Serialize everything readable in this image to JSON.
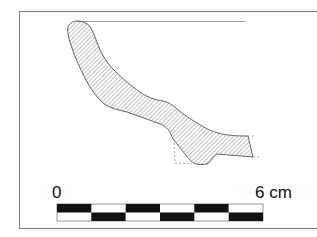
{
  "figure": {
    "type": "pottery-profile-drawing",
    "scale_bar": {
      "start_label": "0",
      "end_label": "6 cm",
      "segments": 6,
      "colors": {
        "dark": "#111111",
        "light": "#ffffff"
      }
    },
    "colors": {
      "frame": "#7a7a7a",
      "outline": "#555555",
      "hatch": "#777777",
      "rim_line": "#8a8a8a"
    }
  }
}
